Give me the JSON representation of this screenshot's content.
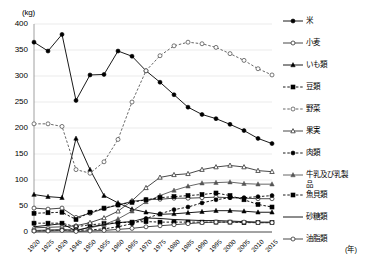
{
  "axis": {
    "unit_label": "(kg)",
    "year_unit": "(年)",
    "yticks": [
      0,
      50,
      100,
      150,
      200,
      250,
      300,
      350,
      400
    ],
    "ylim": [
      0,
      400
    ],
    "xticks": [
      "1920",
      "1925",
      "1929",
      "1946",
      "1950",
      "1955",
      "1960",
      "1965",
      "1970",
      "1975",
      "1980",
      "1985",
      "1990",
      "1995",
      "2000",
      "2005",
      "2010",
      "2015"
    ]
  },
  "chart_data": {
    "type": "line",
    "title": "",
    "xlabel": "(年)",
    "ylabel": "(kg)",
    "ylim": [
      0,
      400
    ],
    "grid": true,
    "legend_position": "right",
    "x": [
      "1920",
      "1925",
      "1929",
      "1946",
      "1950",
      "1955",
      "1960",
      "1965",
      "1970",
      "1975",
      "1980",
      "1985",
      "1990",
      "1995",
      "2000",
      "2005",
      "2010",
      "2015"
    ],
    "series": [
      {
        "name": "米",
        "marker": "filled-circle",
        "dash": "solid",
        "color": "#000000",
        "values": [
          365,
          348,
          380,
          253,
          302,
          303,
          348,
          338,
          310,
          288,
          264,
          240,
          226,
          218,
          207,
          195,
          180,
          170
        ]
      },
      {
        "name": "小麦",
        "marker": "open-circle",
        "dash": "solid",
        "color": "#333333",
        "values": [
          46,
          44,
          46,
          28,
          36,
          45,
          52,
          59,
          62,
          63,
          65,
          65,
          66,
          67,
          66,
          65,
          64,
          64
        ]
      },
      {
        "name": "いも類",
        "marker": "filled-triangle",
        "dash": "solid",
        "color": "#000000",
        "values": [
          72,
          68,
          66,
          180,
          120,
          70,
          56,
          44,
          38,
          34,
          35,
          37,
          39,
          41,
          41,
          40,
          38,
          38
        ]
      },
      {
        "name": "豆類",
        "marker": "filled-square",
        "dash": "dotted",
        "color": "#000000",
        "values": [
          17,
          17,
          17,
          10,
          14,
          16,
          18,
          19,
          20,
          19,
          19,
          19,
          19,
          19,
          19,
          18,
          18,
          18
        ]
      },
      {
        "name": "野菜",
        "marker": "open-circle",
        "dash": "dotted",
        "color": "#555555",
        "values": [
          208,
          208,
          203,
          120,
          113,
          135,
          178,
          250,
          310,
          339,
          358,
          365,
          362,
          355,
          343,
          330,
          314,
          302
        ]
      },
      {
        "name": "果実",
        "marker": "open-triangle",
        "dash": "solid",
        "color": "#333333",
        "values": [
          8,
          9,
          10,
          12,
          18,
          27,
          40,
          60,
          85,
          105,
          110,
          112,
          120,
          125,
          128,
          125,
          118,
          116
        ]
      },
      {
        "name": "肉類",
        "marker": "filled-circle",
        "dash": "dotted",
        "color": "#000000",
        "values": [
          2,
          3,
          4,
          3,
          4,
          6,
          10,
          16,
          26,
          35,
          43,
          48,
          56,
          62,
          66,
          66,
          68,
          70
        ]
      },
      {
        "name": "牛乳及び乳製品",
        "marker": "filled-triangle",
        "dash": "solid",
        "color": "#555555",
        "values": [
          3,
          4,
          5,
          4,
          8,
          14,
          25,
          40,
          58,
          70,
          80,
          88,
          94,
          95,
          96,
          93,
          92,
          92
        ]
      },
      {
        "name": "魚貝類",
        "marker": "filled-square",
        "dash": "dotted",
        "color": "#000000",
        "values": [
          36,
          37,
          38,
          24,
          38,
          46,
          52,
          57,
          62,
          66,
          68,
          70,
          72,
          75,
          70,
          62,
          53,
          48
        ]
      },
      {
        "name": "砂糖類",
        "marker": "none",
        "dash": "solid",
        "color": "#000000",
        "values": [
          10,
          13,
          16,
          2,
          10,
          14,
          18,
          20,
          27,
          26,
          24,
          23,
          22,
          22,
          21,
          20,
          19,
          19
        ]
      },
      {
        "name": "油脂類",
        "marker": "open-circle",
        "dash": "solid",
        "color": "#333333",
        "values": [
          2,
          2,
          3,
          1,
          2,
          3,
          5,
          7,
          10,
          12,
          14,
          16,
          18,
          19,
          19,
          19,
          18,
          18
        ]
      }
    ]
  },
  "legend": {
    "items": [
      {
        "label": "米"
      },
      {
        "label": "小麦"
      },
      {
        "label": "いも類"
      },
      {
        "label": "豆類"
      },
      {
        "label": "野菜"
      },
      {
        "label": "果実"
      },
      {
        "label": "肉類"
      },
      {
        "label": "牛乳及び乳製",
        "label2": "品"
      },
      {
        "label": "魚貝類"
      },
      {
        "label": "砂糖類"
      },
      {
        "label": "油脂類"
      }
    ]
  }
}
